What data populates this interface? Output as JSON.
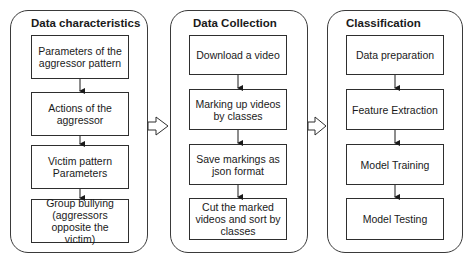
{
  "panels": [
    {
      "title": "Data characteristics",
      "steps": [
        "Parameters of the aggressor pattern",
        "Actions of the aggressor",
        "Victim pattern Parameters",
        "Group bullying (aggressors opposite the victim)"
      ]
    },
    {
      "title": "Data Collection",
      "steps": [
        "Download a video",
        "Marking up videos by classes",
        "Save markings as json format",
        "Cut the marked videos and sort by classes"
      ]
    },
    {
      "title": "Classification",
      "steps": [
        "Data preparation",
        "Feature Extraction",
        "Model Training",
        "Model Testing"
      ]
    }
  ],
  "colors": {
    "stroke": "#2e2e2e",
    "background": "#ffffff"
  }
}
